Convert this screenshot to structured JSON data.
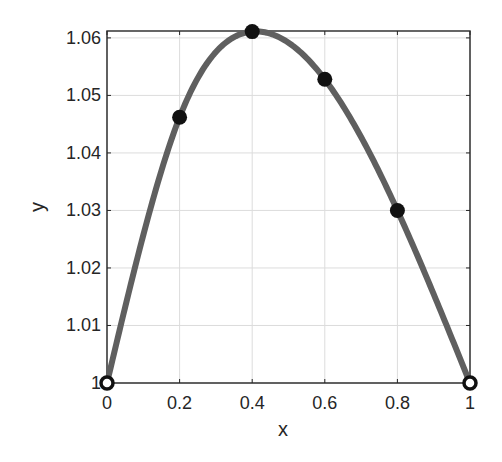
{
  "chart_data": {
    "type": "line",
    "title": "",
    "xlabel": "x",
    "ylabel": "y",
    "xlim": [
      0,
      1
    ],
    "ylim": [
      1,
      1.0612
    ],
    "grid": true,
    "legend": null,
    "x_ticks": [
      0,
      0.2,
      0.4,
      0.6,
      0.8,
      1
    ],
    "x_tick_labels": [
      "0",
      "0.2",
      "0.4",
      "0.6",
      "0.8",
      "1"
    ],
    "y_ticks": [
      1,
      1.01,
      1.02,
      1.03,
      1.04,
      1.05,
      1.06
    ],
    "y_tick_labels": [
      "1",
      "1.01",
      "1.02",
      "1.03",
      "1.04",
      "1.05",
      "1.06"
    ],
    "series": [
      {
        "name": "interpolating curve",
        "style": "line",
        "color": "#5f5f5f",
        "x": [
          0,
          0.2,
          0.4,
          0.6,
          0.8,
          1
        ],
        "values": [
          1.0,
          1.0462,
          1.0611,
          1.0528,
          1.03,
          1.0
        ]
      },
      {
        "name": "data points",
        "style": "markers",
        "color": "#111111",
        "x": [
          0,
          0.2,
          0.4,
          0.6,
          0.8,
          1
        ],
        "values": [
          1.0,
          1.0462,
          1.0611,
          1.0528,
          1.03,
          1.0
        ],
        "hollow_endpoints": true
      }
    ]
  },
  "colors": {
    "axis": "#262626",
    "grid": "#dcdcdc",
    "curve": "#5f5f5f",
    "marker": "#111111",
    "background": "#ffffff"
  }
}
